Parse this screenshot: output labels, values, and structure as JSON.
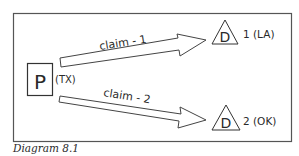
{
  "diagram": {
    "caption": "Diagram 8.1",
    "plaintiff": {
      "letter": "P",
      "location": "(TX)"
    },
    "claims": [
      {
        "label": "claim - 1"
      },
      {
        "label": "claim - 2"
      }
    ],
    "defendants": [
      {
        "letter": "D",
        "label": "1 (LA)"
      },
      {
        "letter": "D",
        "label": "2 (OK)"
      }
    ],
    "colors": {
      "stroke": "#4a4a4a",
      "text": "#2a2a2a",
      "background": "#ffffff"
    }
  }
}
